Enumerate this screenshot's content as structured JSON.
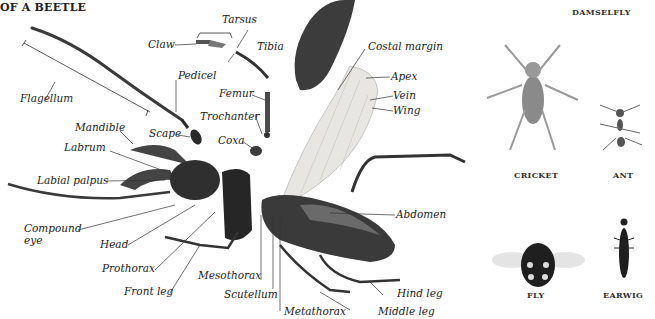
{
  "page": {
    "title": "OF A BEETLE"
  },
  "side_specimens": {
    "header": "DAMSELFLY",
    "items": [
      {
        "name": "CRICKET"
      },
      {
        "name": "ANT"
      },
      {
        "name": "FLY"
      },
      {
        "name": "EARWIG"
      }
    ]
  },
  "labels": {
    "tarsus": "Tarsus",
    "claw": "Claw",
    "tibia": "Tibia",
    "flagellum": "Flagellum",
    "pedicel": "Pedicel",
    "femur": "Femur",
    "trochanter": "Trochanter",
    "scape": "Scape",
    "coxa": "Coxa",
    "mandible": "Mandible",
    "labrum": "Labrum",
    "labial_palpus": "Labial palpus",
    "compound_eye_1": "Compound",
    "compound_eye_2": "eye",
    "head": "Head",
    "prothorax": "Prothorax",
    "front_leg": "Front leg",
    "mesothorax": "Mesothorax",
    "scutellum": "Scutellum",
    "metathorax": "Metathorax",
    "middle_leg": "Middle leg",
    "hind_leg": "Hind leg",
    "abdomen": "Abdomen",
    "costal_margin": "Costal margin",
    "apex": "Apex",
    "vein": "Vein",
    "wing": "Wing"
  }
}
